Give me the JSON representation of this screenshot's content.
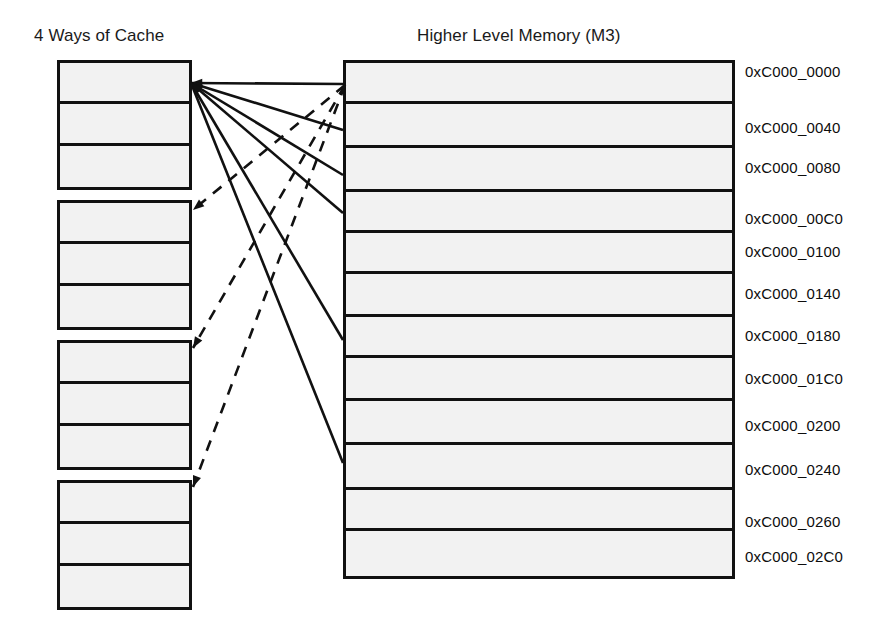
{
  "figure": {
    "cache_title": "4 Ways of Cache",
    "memory_title": "Higher Level Memory (M3)"
  },
  "cache": {
    "geometry": {
      "x": 57,
      "y": 60,
      "width": 135,
      "group_height": 130,
      "group_gap": 10,
      "row_height": 43
    },
    "ways": [
      {
        "name": "way-0",
        "rows": [
          "",
          "",
          ""
        ]
      },
      {
        "name": "way-1",
        "rows": [
          "",
          "",
          ""
        ]
      },
      {
        "name": "way-2",
        "rows": [
          "",
          "",
          ""
        ]
      },
      {
        "name": "way-3",
        "rows": [
          "",
          "",
          ""
        ]
      }
    ]
  },
  "memory": {
    "geometry": {
      "x": 343,
      "y": 60,
      "width": 392,
      "height": 519
    },
    "rows": [
      {
        "address": "0xC000_0000",
        "height": 41
      },
      {
        "address": "0xC000_0040",
        "height": 45
      },
      {
        "address": "0xC000_0080",
        "height": 45
      },
      {
        "address": "0xC000_00C0",
        "height": 41
      },
      {
        "address": "0xC000_0100",
        "height": 42
      },
      {
        "address": "0xC000_0140",
        "height": 43
      },
      {
        "address": "0xC000_0180",
        "height": 42
      },
      {
        "address": "0xC000_01C0",
        "height": 43
      },
      {
        "address": "0xC000_0200",
        "height": 45
      },
      {
        "address": "0xC000_0240",
        "height": 45
      },
      {
        "address": "0xC000_0260",
        "height": 42
      },
      {
        "address": "0xC000_02C0",
        "height": 45
      }
    ],
    "label_x": 745,
    "label_y_offsets": [
      72,
      128,
      168,
      219,
      252,
      294,
      336,
      379,
      426,
      470,
      522,
      557
    ]
  },
  "connections": {
    "solid_style": {
      "color": "#111111",
      "width": 2.6
    },
    "dashed_style": {
      "color": "#111111",
      "width": 2.6,
      "dash": "11,9"
    },
    "solid_origin": {
      "x": 191,
      "y": 83
    },
    "solid_targets": [
      {
        "x": 343,
        "y": 84
      },
      {
        "x": 343,
        "y": 130
      },
      {
        "x": 343,
        "y": 175
      },
      {
        "x": 343,
        "y": 213
      },
      {
        "x": 343,
        "y": 340
      },
      {
        "x": 343,
        "y": 463
      }
    ],
    "dashed_origin": {
      "x": 345,
      "y": 85
    },
    "dashed_targets": [
      {
        "x": 193,
        "y": 210
      },
      {
        "x": 193,
        "y": 348
      },
      {
        "x": 193,
        "y": 487
      }
    ]
  },
  "colors": {
    "stroke": "#111111",
    "fill": "#f2f2f2",
    "text": "#0d0d0d",
    "background": "#ffffff"
  }
}
